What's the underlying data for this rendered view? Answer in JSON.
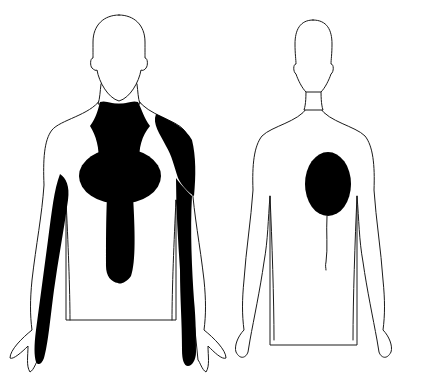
{
  "diagram": {
    "type": "body-pain-referral-map",
    "views": [
      {
        "id": "front",
        "label": "Anterior view",
        "regions": [
          "neck-jaw",
          "central-chest",
          "sternum-epigastric",
          "left-shoulder",
          "left-arm-inner",
          "right-arm-inner"
        ]
      },
      {
        "id": "back",
        "label": "Posterior view",
        "regions": [
          "interscapular"
        ]
      }
    ],
    "colors": {
      "outline": "#1a1a1a",
      "shaded": "#000000",
      "background": "#ffffff"
    }
  }
}
